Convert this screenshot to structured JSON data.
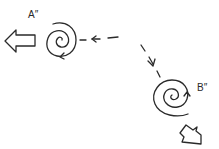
{
  "diagram": {
    "type": "hand-drawn schematic",
    "nodes": [
      {
        "id": "A",
        "label": "A″",
        "shape": "spiral",
        "center": [
          62,
          40
        ]
      },
      {
        "id": "B",
        "label": "B″",
        "shape": "spiral",
        "center": [
          172,
          98
        ]
      }
    ],
    "edges": [
      {
        "from": "B",
        "to": "A",
        "style": "dashed",
        "arrow": "arrowhead toward A"
      }
    ],
    "outputs": [
      {
        "node": "A",
        "shape": "hollow block arrow",
        "direction": "left"
      },
      {
        "node": "B",
        "shape": "hollow block arrow",
        "direction": "down-right"
      }
    ],
    "colors": {
      "ink": "#2a2a2a",
      "background": "#ffffff"
    }
  }
}
